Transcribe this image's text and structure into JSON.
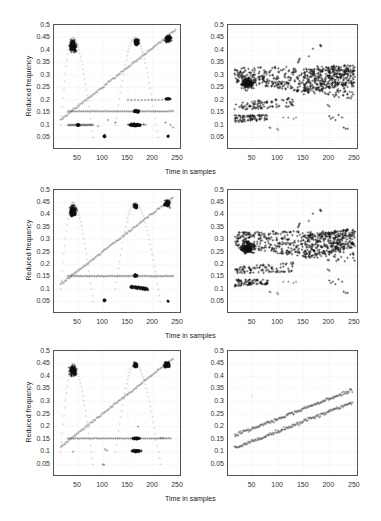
{
  "figure": {
    "xlabel": "Time in samples",
    "ylabel": "Reduced frequency",
    "rows": 3,
    "cols": 2
  },
  "axes": {
    "xticks": [
      "50",
      "100",
      "150",
      "200",
      "250"
    ],
    "xtick_values": [
      50,
      100,
      150,
      200,
      250
    ],
    "yticks": [
      "0.05",
      "0.1",
      "0.15",
      "0.2",
      "0.25",
      "0.3",
      "0.35",
      "0.4",
      "0.45",
      "0.5"
    ],
    "ytick_values": [
      0.05,
      0.1,
      0.15,
      0.2,
      0.25,
      0.3,
      0.35,
      0.4,
      0.45,
      0.5
    ],
    "xlim": [
      2,
      258
    ],
    "ylim": [
      0,
      0.5
    ],
    "grid": true
  },
  "colors": {
    "frame": "#555555",
    "grid": "#dddddd",
    "marker_dark": "#1a1a1a",
    "marker_light": "#888888",
    "line": "#aaaaaa"
  },
  "chart_data": [
    {
      "id": "row1-left",
      "type": "scatter",
      "title": "",
      "xlabel": "",
      "ylabel": "Reduced frequency",
      "xlim": [
        2,
        258
      ],
      "ylim": [
        0,
        0.5
      ],
      "grid": true,
      "marker": "+",
      "series": [
        {
          "name": "linear chirp",
          "kind": "line",
          "x": [
            15,
            245
          ],
          "y": [
            0.12,
            0.48
          ],
          "density": 120,
          "spread": 0.004,
          "shade": "light"
        },
        {
          "name": "sinusoidal FM arch 1",
          "kind": "arch",
          "x0": 15,
          "x1": 80,
          "peak_x": 40,
          "ymin": 0.15,
          "ymax": 0.45,
          "density": 40,
          "shade": "faint"
        },
        {
          "name": "sinusoidal FM arch 2",
          "kind": "arch",
          "x0": 125,
          "x1": 210,
          "peak_x": 165,
          "ymin": 0.15,
          "ymax": 0.45,
          "density": 45,
          "shade": "faint"
        },
        {
          "name": "arch 1 top cluster",
          "kind": "blob",
          "cx": 40,
          "cy": 0.415,
          "rx": 12,
          "ry": 0.04,
          "n": 160,
          "shade": "dark"
        },
        {
          "name": "arch 2 top cluster",
          "kind": "blob",
          "cx": 167,
          "cy": 0.43,
          "rx": 8,
          "ry": 0.025,
          "n": 90,
          "shade": "dark"
        },
        {
          "name": "chirp end cluster",
          "kind": "blob",
          "cx": 230,
          "cy": 0.445,
          "rx": 12,
          "ry": 0.025,
          "n": 90,
          "shade": "dark"
        },
        {
          "name": "cross term 0.15",
          "kind": "hline",
          "x": [
            30,
            240
          ],
          "y": 0.155,
          "n": 55,
          "shade": "mid"
        },
        {
          "name": "cluster 0.15 @165",
          "kind": "blob",
          "cx": 167,
          "cy": 0.155,
          "rx": 12,
          "ry": 0.008,
          "n": 70,
          "shade": "dark"
        },
        {
          "name": "cross term 0.1 left",
          "kind": "hline",
          "x": [
            30,
            80
          ],
          "y": 0.1,
          "n": 30,
          "shade": "mid"
        },
        {
          "name": "cluster 0.1 @50",
          "kind": "blob",
          "cx": 50,
          "cy": 0.1,
          "rx": 6,
          "ry": 0.006,
          "n": 30,
          "shade": "dark"
        },
        {
          "name": "cluster 0.1 @165",
          "kind": "blob",
          "cx": 165,
          "cy": 0.1,
          "rx": 22,
          "ry": 0.01,
          "n": 130,
          "shade": "dark"
        },
        {
          "name": "cluster 0.2 @230",
          "kind": "blob",
          "cx": 230,
          "cy": 0.205,
          "rx": 8,
          "ry": 0.005,
          "n": 30,
          "shade": "dark"
        },
        {
          "name": "cross term 0.2",
          "kind": "hline",
          "x": [
            150,
            225
          ],
          "y": 0.2,
          "n": 12,
          "shade": "mid"
        },
        {
          "name": "cluster 0.05 @103",
          "kind": "blob",
          "cx": 103,
          "cy": 0.055,
          "rx": 4,
          "ry": 0.008,
          "n": 25,
          "shade": "dark"
        },
        {
          "name": "cluster 0.05 @230",
          "kind": "blob",
          "cx": 230,
          "cy": 0.055,
          "rx": 2,
          "ry": 0.006,
          "n": 8,
          "shade": "dark"
        },
        {
          "name": "misc 0.1",
          "kind": "points",
          "x": [
            90,
            110,
            125,
            185,
            225,
            235,
            240
          ],
          "y": [
            0.095,
            0.12,
            0.11,
            0.1,
            0.11,
            0.1,
            0.09
          ],
          "shade": "mid"
        }
      ]
    },
    {
      "id": "row1-right",
      "type": "scatter",
      "xlim": [
        2,
        258
      ],
      "ylim": [
        0,
        0.5
      ],
      "grid": true,
      "marker": "+",
      "series": [
        {
          "name": "upper band",
          "kind": "band",
          "x": [
            15,
            250
          ],
          "y0": [
            0.27,
            0.2
          ],
          "y1": [
            0.33,
            0.34
          ],
          "n": 420,
          "shade": "dark"
        },
        {
          "name": "left upper cluster",
          "kind": "blob",
          "cx": 40,
          "cy": 0.265,
          "rx": 25,
          "ry": 0.04,
          "n": 160,
          "shade": "dark"
        },
        {
          "name": "mid band",
          "kind": "band",
          "x": [
            15,
            130
          ],
          "y0": [
            0.16,
            0.17
          ],
          "y1": [
            0.19,
            0.21
          ],
          "n": 90,
          "shade": "dark"
        },
        {
          "name": "lower band",
          "kind": "band",
          "x": [
            15,
            80
          ],
          "y0": [
            0.11,
            0.12
          ],
          "y1": [
            0.14,
            0.14
          ],
          "n": 80,
          "shade": "dark"
        },
        {
          "name": "right upper",
          "kind": "band",
          "x": [
            150,
            250
          ],
          "y0": [
            0.22,
            0.27
          ],
          "y1": [
            0.32,
            0.345
          ],
          "n": 260,
          "shade": "dark"
        },
        {
          "name": "isolated high",
          "kind": "points",
          "x": [
            139,
            140,
            141,
            142,
            160,
            168,
            182,
            183,
            184
          ],
          "y": [
            0.35,
            0.355,
            0.36,
            0.365,
            0.375,
            0.405,
            0.42,
            0.418,
            0.415
          ],
          "shade": "dark"
        },
        {
          "name": "lower right",
          "kind": "points",
          "x": [
            200,
            203,
            207,
            212,
            218,
            225,
            228,
            232,
            236,
            197,
            200
          ],
          "y": [
            0.135,
            0.125,
            0.13,
            0.12,
            0.14,
            0.13,
            0.09,
            0.085,
            0.085,
            0.18,
            0.175
          ],
          "shade": "dark"
        },
        {
          "name": "low points",
          "kind": "points",
          "x": [
            83,
            85,
            98,
            100,
            110,
            120,
            130,
            135
          ],
          "y": [
            0.09,
            0.088,
            0.085,
            0.08,
            0.13,
            0.13,
            0.125,
            0.13
          ],
          "shade": "mid"
        }
      ]
    },
    {
      "id": "row2-left",
      "type": "scatter",
      "xlim": [
        2,
        258
      ],
      "ylim": [
        0,
        0.5
      ],
      "grid": true,
      "marker": "+",
      "series": [
        {
          "name": "linear chirp",
          "kind": "line",
          "x": [
            15,
            240
          ],
          "y": [
            0.12,
            0.47
          ],
          "density": 120,
          "spread": 0.004,
          "shade": "light"
        },
        {
          "name": "sinusoidal FM arch 1",
          "kind": "arch",
          "x0": 15,
          "x1": 80,
          "peak_x": 40,
          "ymin": 0.15,
          "ymax": 0.45,
          "density": 40,
          "shade": "faint"
        },
        {
          "name": "sinusoidal FM arch 2",
          "kind": "arch",
          "x0": 125,
          "x1": 215,
          "peak_x": 165,
          "ymin": 0.15,
          "ymax": 0.45,
          "density": 45,
          "shade": "faint"
        },
        {
          "name": "arch 1 top cluster",
          "kind": "blob",
          "cx": 40,
          "cy": 0.415,
          "rx": 12,
          "ry": 0.04,
          "n": 160,
          "shade": "dark"
        },
        {
          "name": "arch 2 top cluster",
          "kind": "blob",
          "cx": 165,
          "cy": 0.435,
          "rx": 7,
          "ry": 0.018,
          "n": 60,
          "shade": "dark"
        },
        {
          "name": "chirp end cluster",
          "kind": "blob",
          "cx": 228,
          "cy": 0.445,
          "rx": 10,
          "ry": 0.022,
          "n": 80,
          "shade": "dark"
        },
        {
          "name": "cross term 0.15",
          "kind": "hline",
          "x": [
            30,
            240
          ],
          "y": 0.153,
          "n": 60,
          "shade": "mid"
        },
        {
          "name": "cluster 0.15 @165",
          "kind": "blob",
          "cx": 165,
          "cy": 0.155,
          "rx": 5,
          "ry": 0.01,
          "n": 40,
          "shade": "dark"
        },
        {
          "name": "cluster 0.1 @170",
          "kind": "band",
          "x": [
            155,
            190
          ],
          "y0": [
            0.105,
            0.095
          ],
          "y1": [
            0.115,
            0.105
          ],
          "n": 90,
          "shade": "dark"
        },
        {
          "name": "cluster 0.05 @103",
          "kind": "blob",
          "cx": 103,
          "cy": 0.055,
          "rx": 4,
          "ry": 0.006,
          "n": 20,
          "shade": "dark"
        },
        {
          "name": "cluster 0.05 @230",
          "kind": "blob",
          "cx": 230,
          "cy": 0.052,
          "rx": 2,
          "ry": 0.004,
          "n": 6,
          "shade": "dark"
        }
      ]
    },
    {
      "id": "row2-right",
      "type": "scatter",
      "xlim": [
        2,
        258
      ],
      "ylim": [
        0,
        0.5
      ],
      "grid": true,
      "marker": "+",
      "series": [
        {
          "name": "upper band",
          "kind": "band",
          "x": [
            15,
            250
          ],
          "y0": [
            0.27,
            0.2
          ],
          "y1": [
            0.33,
            0.34
          ],
          "n": 420,
          "shade": "dark"
        },
        {
          "name": "left upper cluster",
          "kind": "blob",
          "cx": 40,
          "cy": 0.265,
          "rx": 25,
          "ry": 0.04,
          "n": 160,
          "shade": "dark"
        },
        {
          "name": "mid band",
          "kind": "band",
          "x": [
            15,
            130
          ],
          "y0": [
            0.16,
            0.17
          ],
          "y1": [
            0.19,
            0.21
          ],
          "n": 90,
          "shade": "dark"
        },
        {
          "name": "lower band",
          "kind": "band",
          "x": [
            15,
            80
          ],
          "y0": [
            0.11,
            0.12
          ],
          "y1": [
            0.14,
            0.14
          ],
          "n": 80,
          "shade": "dark"
        },
        {
          "name": "right upper",
          "kind": "band",
          "x": [
            150,
            250
          ],
          "y0": [
            0.22,
            0.27
          ],
          "y1": [
            0.32,
            0.345
          ],
          "n": 260,
          "shade": "dark"
        },
        {
          "name": "isolated high",
          "kind": "points",
          "x": [
            139,
            140,
            141,
            142,
            160,
            168,
            182,
            183,
            184
          ],
          "y": [
            0.35,
            0.355,
            0.36,
            0.365,
            0.375,
            0.405,
            0.42,
            0.418,
            0.415
          ],
          "shade": "dark"
        },
        {
          "name": "lower right",
          "kind": "points",
          "x": [
            200,
            203,
            207,
            212,
            218,
            225,
            228,
            232,
            236,
            197,
            200
          ],
          "y": [
            0.135,
            0.125,
            0.13,
            0.12,
            0.14,
            0.13,
            0.09,
            0.085,
            0.085,
            0.18,
            0.175
          ],
          "shade": "dark"
        },
        {
          "name": "low points",
          "kind": "points",
          "x": [
            83,
            85,
            98,
            100,
            110,
            120,
            130,
            135
          ],
          "y": [
            0.09,
            0.088,
            0.085,
            0.08,
            0.13,
            0.13,
            0.125,
            0.13
          ],
          "shade": "mid"
        }
      ]
    },
    {
      "id": "row3-left",
      "type": "scatter",
      "xlim": [
        2,
        258
      ],
      "ylim": [
        0,
        0.5
      ],
      "grid": true,
      "marker": "+",
      "series": [
        {
          "name": "linear chirp",
          "kind": "line",
          "x": [
            15,
            240
          ],
          "y": [
            0.12,
            0.47
          ],
          "density": 120,
          "spread": 0.004,
          "shade": "light"
        },
        {
          "name": "sinusoidal FM arch 1",
          "kind": "arch",
          "x0": 15,
          "x1": 80,
          "peak_x": 40,
          "ymin": 0.15,
          "ymax": 0.45,
          "density": 40,
          "shade": "faint"
        },
        {
          "name": "sinusoidal FM arch 2",
          "kind": "arch",
          "x0": 125,
          "x1": 215,
          "peak_x": 165,
          "ymin": 0.15,
          "ymax": 0.45,
          "density": 45,
          "shade": "faint"
        },
        {
          "name": "arch 1 top cluster",
          "kind": "blob",
          "cx": 40,
          "cy": 0.42,
          "rx": 12,
          "ry": 0.035,
          "n": 150,
          "shade": "dark"
        },
        {
          "name": "arch 2 top cluster",
          "kind": "blob",
          "cx": 165,
          "cy": 0.445,
          "rx": 7,
          "ry": 0.018,
          "n": 55,
          "shade": "dark"
        },
        {
          "name": "chirp end cluster",
          "kind": "blob",
          "cx": 228,
          "cy": 0.445,
          "rx": 10,
          "ry": 0.022,
          "n": 80,
          "shade": "dark"
        },
        {
          "name": "cross term 0.15",
          "kind": "hline",
          "x": [
            30,
            235
          ],
          "y": 0.153,
          "n": 55,
          "shade": "mid"
        },
        {
          "name": "cluster 0.15 @165",
          "kind": "blob",
          "cx": 167,
          "cy": 0.153,
          "rx": 15,
          "ry": 0.007,
          "n": 60,
          "shade": "dark"
        },
        {
          "name": "cluster 0.1 @165",
          "kind": "blob",
          "cx": 167,
          "cy": 0.103,
          "rx": 16,
          "ry": 0.007,
          "n": 70,
          "shade": "dark"
        },
        {
          "name": "misc",
          "kind": "points",
          "x": [
            40,
            100,
            102,
            104,
            108,
            170,
            215,
            220
          ],
          "y": [
            0.1,
            0.05,
            0.048,
            0.11,
            0.105,
            0.2,
            0.155,
            0.155
          ],
          "shade": "mid"
        }
      ]
    },
    {
      "id": "row3-right",
      "type": "scatter",
      "xlim": [
        2,
        258
      ],
      "ylim": [
        0,
        0.5
      ],
      "grid": true,
      "marker": "+",
      "series": [
        {
          "name": "upper chirp component",
          "kind": "line",
          "x": [
            15,
            245
          ],
          "y": [
            0.165,
            0.345
          ],
          "density": 140,
          "spread": 0.007,
          "shade": "mid"
        },
        {
          "name": "lower chirp component",
          "kind": "line",
          "x": [
            15,
            245
          ],
          "y": [
            0.115,
            0.295
          ],
          "density": 140,
          "spread": 0.007,
          "shade": "mid"
        },
        {
          "name": "outlier",
          "kind": "points",
          "x": [
            48
          ],
          "y": [
            0.32
          ],
          "shade": "faint"
        }
      ]
    }
  ]
}
